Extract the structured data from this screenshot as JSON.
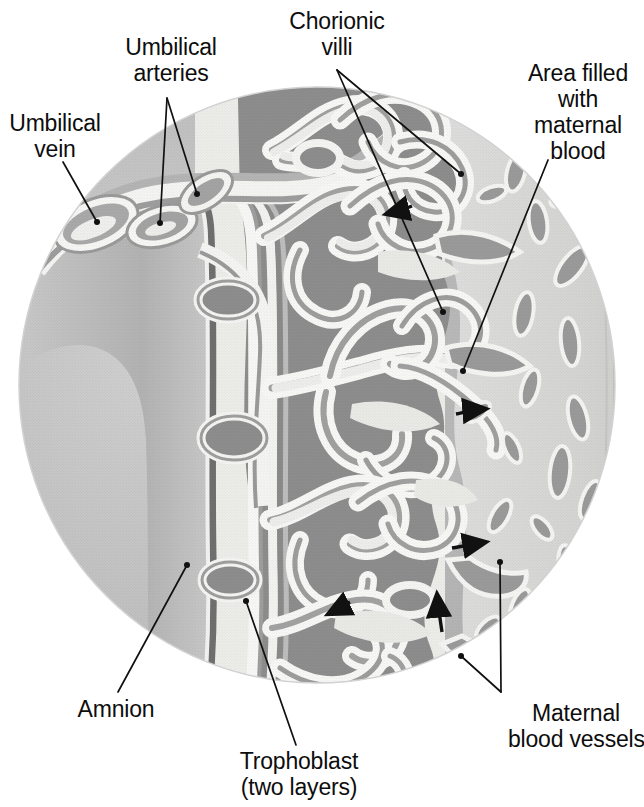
{
  "figure": {
    "kind": "anatomical-illustration",
    "shape": "circular-inset",
    "palette": {
      "background": "#ffffff",
      "fetal_side_gray": "#b9b9b9",
      "villi_stroma_dark": "#8e8e8e",
      "intervillous_space_light": "#eeeeec",
      "endometrium_light": "#d8d8d6",
      "maternal_vessel_gray": "#9a9a9a",
      "vessel_wall_mid": "#a8a8a8",
      "leader_line": "#111111",
      "circle_edge": "#cfcfcf"
    }
  },
  "labels": [
    {
      "id": "umbilical-vein",
      "lines": [
        "Umbilical",
        "vein"
      ],
      "text": "Umbilical vein",
      "x": 5,
      "y": 110,
      "width": 100,
      "leaders": [
        {
          "from": [
            63,
            162
          ],
          "to": [
            97,
            222
          ]
        }
      ]
    },
    {
      "id": "umbilical-arteries",
      "lines": [
        "Umbilical",
        "arteries"
      ],
      "text": "Umbilical arteries",
      "x": 110,
      "y": 34,
      "width": 122,
      "leaders": [
        {
          "from": [
            167,
            98
          ],
          "to": [
            160,
            223
          ]
        },
        {
          "from": [
            167,
            98
          ],
          "to": [
            197,
            194
          ]
        }
      ]
    },
    {
      "id": "chorionic-villi",
      "lines": [
        "Chorionic",
        "villi"
      ],
      "text": "Chorionic villi",
      "x": 274,
      "y": 8,
      "width": 126,
      "leaders": [
        {
          "from": [
            337,
            70
          ],
          "to": [
            461,
            174
          ]
        },
        {
          "from": [
            337,
            70
          ],
          "to": [
            443,
            312
          ]
        }
      ]
    },
    {
      "id": "area-filled-with-maternal-blood",
      "lines": [
        "Area filled",
        "with",
        "maternal",
        "blood"
      ],
      "text": "Area filled with maternal blood",
      "x": 516,
      "y": 60,
      "width": 124,
      "leaders": [
        {
          "from": [
            548,
            160
          ],
          "to": [
            463,
            371
          ]
        }
      ]
    },
    {
      "id": "maternal-blood-vessels",
      "lines": [
        "Maternal",
        "blood vessels"
      ],
      "text": "Maternal blood vessels",
      "x": 508,
      "y": 700,
      "width": 136,
      "leaders": [
        {
          "from": [
            501,
            692
          ],
          "to": [
            500,
            562
          ]
        },
        {
          "from": [
            501,
            692
          ],
          "to": [
            461,
            656
          ]
        }
      ]
    },
    {
      "id": "amnion",
      "lines": [
        "Amnion"
      ],
      "text": "Amnion",
      "x": 70,
      "y": 696,
      "width": 92,
      "leaders": [
        {
          "from": [
            118,
            692
          ],
          "to": [
            187,
            565
          ]
        }
      ]
    },
    {
      "id": "trophoblast",
      "lines": [
        "Trophoblast",
        "(two layers)"
      ],
      "text": "Trophoblast (two layers)",
      "x": 229,
      "y": 748,
      "width": 140,
      "leaders": [
        {
          "from": [
            296,
            745
          ],
          "to": [
            246,
            601
          ]
        }
      ]
    }
  ],
  "flow_arrows": [
    {
      "id": "maternal-blood-flow-arrow-1",
      "x": 395,
      "y": 212,
      "angle": 200
    },
    {
      "id": "maternal-blood-flow-arrow-2",
      "x": 480,
      "y": 410,
      "angle": 20
    },
    {
      "id": "maternal-blood-flow-arrow-3",
      "x": 480,
      "y": 545,
      "angle": 15
    },
    {
      "id": "maternal-blood-flow-arrow-4",
      "x": 440,
      "y": 600,
      "angle": 290
    },
    {
      "id": "maternal-blood-flow-arrow-5",
      "x": 330,
      "y": 610,
      "angle": 205
    }
  ]
}
